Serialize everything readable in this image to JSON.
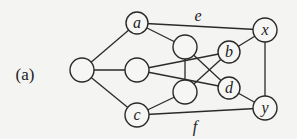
{
  "figure": {
    "caption": "(a)",
    "caption_pos": {
      "x": 25,
      "y": 80
    }
  },
  "graph": {
    "nodes": [
      {
        "id": "L",
        "label": "",
        "x": 82,
        "y": 70,
        "r": 12
      },
      {
        "id": "a",
        "label": "a",
        "x": 137,
        "y": 23,
        "r": 11
      },
      {
        "id": "M",
        "label": "",
        "x": 137,
        "y": 70,
        "r": 12
      },
      {
        "id": "c",
        "label": "c",
        "x": 137,
        "y": 115,
        "r": 12
      },
      {
        "id": "U",
        "label": "",
        "x": 185,
        "y": 47,
        "r": 12
      },
      {
        "id": "L2",
        "label": "",
        "x": 185,
        "y": 92,
        "r": 12
      },
      {
        "id": "b",
        "label": "b",
        "x": 229,
        "y": 52,
        "r": 11
      },
      {
        "id": "d",
        "label": "d",
        "x": 229,
        "y": 88,
        "r": 11
      },
      {
        "id": "x",
        "label": "x",
        "x": 265,
        "y": 30,
        "r": 12
      },
      {
        "id": "y",
        "label": "y",
        "x": 265,
        "y": 108,
        "r": 12
      }
    ],
    "edges": [
      {
        "from": "L",
        "to": "a",
        "label": ""
      },
      {
        "from": "L",
        "to": "M",
        "label": ""
      },
      {
        "from": "L",
        "to": "c",
        "label": ""
      },
      {
        "from": "a",
        "to": "U",
        "label": ""
      },
      {
        "from": "a",
        "to": "x",
        "label": "e"
      },
      {
        "from": "M",
        "to": "b",
        "label": ""
      },
      {
        "from": "M",
        "to": "d",
        "label": ""
      },
      {
        "from": "U",
        "to": "L2",
        "label": ""
      },
      {
        "from": "U",
        "to": "d",
        "label": ""
      },
      {
        "from": "L2",
        "to": "b",
        "label": ""
      },
      {
        "from": "L2",
        "to": "c",
        "label": ""
      },
      {
        "from": "b",
        "to": "x",
        "label": ""
      },
      {
        "from": "d",
        "to": "y",
        "label": ""
      },
      {
        "from": "c",
        "to": "y",
        "label": "f"
      },
      {
        "from": "x",
        "to": "y",
        "label": ""
      }
    ],
    "edge_labels": [
      {
        "text": "e",
        "x": 198,
        "y": 21
      },
      {
        "text": "f",
        "x": 195,
        "y": 132
      }
    ]
  }
}
